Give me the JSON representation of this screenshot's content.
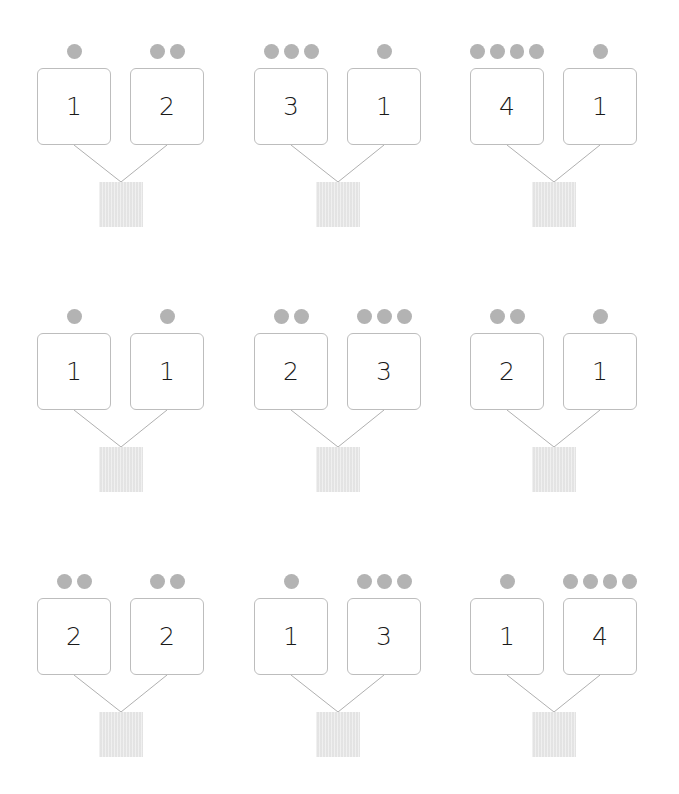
{
  "colors": {
    "dot": "#b3b3b3",
    "box_border": "#bdbdbd",
    "answer_fill": "#e8e8e8",
    "line": "#b0b0b0"
  },
  "groups": [
    {
      "left": {
        "value": "1",
        "dots": 1
      },
      "right": {
        "value": "2",
        "dots": 2
      },
      "answer": ""
    },
    {
      "left": {
        "value": "3",
        "dots": 3
      },
      "right": {
        "value": "1",
        "dots": 1
      },
      "answer": ""
    },
    {
      "left": {
        "value": "4",
        "dots": 4
      },
      "right": {
        "value": "1",
        "dots": 1
      },
      "answer": ""
    },
    {
      "left": {
        "value": "1",
        "dots": 1
      },
      "right": {
        "value": "1",
        "dots": 1
      },
      "answer": ""
    },
    {
      "left": {
        "value": "2",
        "dots": 2
      },
      "right": {
        "value": "3",
        "dots": 3
      },
      "answer": ""
    },
    {
      "left": {
        "value": "2",
        "dots": 2
      },
      "right": {
        "value": "1",
        "dots": 1
      },
      "answer": ""
    },
    {
      "left": {
        "value": "2",
        "dots": 2
      },
      "right": {
        "value": "2",
        "dots": 2
      },
      "answer": ""
    },
    {
      "left": {
        "value": "1",
        "dots": 1
      },
      "right": {
        "value": "3",
        "dots": 3
      },
      "answer": ""
    },
    {
      "left": {
        "value": "1",
        "dots": 1
      },
      "right": {
        "value": "4",
        "dots": 4
      },
      "answer": ""
    }
  ]
}
